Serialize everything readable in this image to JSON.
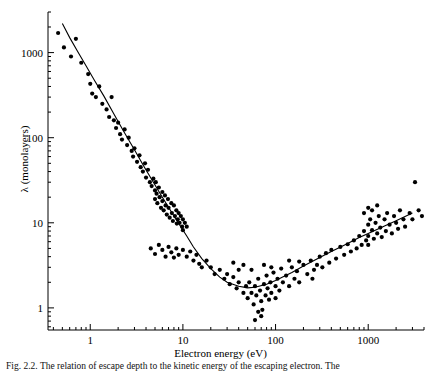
{
  "chart_data": {
    "type": "scatter",
    "title": "",
    "xlabel": "Electron energy (eV)",
    "ylabel": "λ (monolayers)",
    "xscale": "log",
    "yscale": "log",
    "xlim": [
      0.35,
      4000
    ],
    "ylim": [
      0.55,
      3000
    ],
    "xticks": [
      1,
      10,
      100,
      1000
    ],
    "xtick_labels": [
      "1",
      "10",
      "100",
      "1000"
    ],
    "yticks": [
      1,
      10,
      100,
      1000
    ],
    "ytick_labels": [
      "1",
      "10",
      "100",
      "1000"
    ],
    "grid": false,
    "legend": "none",
    "series": [
      {
        "name": "universal curve fit",
        "type": "line",
        "points": [
          [
            0.5,
            2200
          ],
          [
            0.6,
            1500
          ],
          [
            0.75,
            980
          ],
          [
            0.9,
            700
          ],
          [
            1.1,
            480
          ],
          [
            1.4,
            310
          ],
          [
            1.8,
            190
          ],
          [
            2.3,
            118
          ],
          [
            3.0,
            72
          ],
          [
            3.8,
            46
          ],
          [
            4.8,
            30
          ],
          [
            6.0,
            20
          ],
          [
            7.5,
            13.5
          ],
          [
            9.0,
            9.8
          ],
          [
            11,
            7.0
          ],
          [
            13,
            5.2
          ],
          [
            16,
            3.8
          ],
          [
            20,
            2.9
          ],
          [
            25,
            2.3
          ],
          [
            30,
            2.0
          ],
          [
            40,
            1.8
          ],
          [
            50,
            1.72
          ],
          [
            60,
            1.75
          ],
          [
            80,
            1.9
          ],
          [
            100,
            2.1
          ],
          [
            150,
            2.6
          ],
          [
            200,
            3.1
          ],
          [
            300,
            3.9
          ],
          [
            400,
            4.6
          ],
          [
            600,
            5.7
          ],
          [
            800,
            6.7
          ],
          [
            1000,
            7.5
          ],
          [
            1500,
            9.2
          ],
          [
            2000,
            10.6
          ],
          [
            3000,
            13.0
          ]
        ]
      },
      {
        "name": "measured escape depths",
        "type": "scatter",
        "points": [
          [
            0.45,
            1700
          ],
          [
            0.52,
            1150
          ],
          [
            0.62,
            900
          ],
          [
            0.7,
            1450
          ],
          [
            0.8,
            760
          ],
          [
            0.95,
            560
          ],
          [
            1.0,
            430
          ],
          [
            1.05,
            330
          ],
          [
            1.15,
            300
          ],
          [
            1.25,
            400
          ],
          [
            1.35,
            250
          ],
          [
            1.5,
            215
          ],
          [
            1.6,
            175
          ],
          [
            1.7,
            300
          ],
          [
            1.8,
            160
          ],
          [
            1.9,
            130
          ],
          [
            2.0,
            150
          ],
          [
            2.1,
            110
          ],
          [
            2.2,
            95
          ],
          [
            2.35,
            125
          ],
          [
            2.5,
            82
          ],
          [
            2.6,
            100
          ],
          [
            2.8,
            70
          ],
          [
            2.9,
            60
          ],
          [
            3.0,
            75
          ],
          [
            3.2,
            52
          ],
          [
            3.4,
            62
          ],
          [
            3.5,
            45
          ],
          [
            3.7,
            40
          ],
          [
            3.9,
            50
          ],
          [
            4.0,
            34
          ],
          [
            4.2,
            42
          ],
          [
            4.4,
            30
          ],
          [
            4.6,
            27
          ],
          [
            4.8,
            33
          ],
          [
            5.0,
            24
          ],
          [
            5.0,
            19
          ],
          [
            5.1,
            30
          ],
          [
            5.2,
            22
          ],
          [
            5.3,
            17
          ],
          [
            5.5,
            26
          ],
          [
            5.6,
            20
          ],
          [
            5.8,
            15
          ],
          [
            6.0,
            23
          ],
          [
            6.0,
            18
          ],
          [
            6.2,
            14
          ],
          [
            6.4,
            21
          ],
          [
            6.5,
            16
          ],
          [
            6.7,
            12.5
          ],
          [
            6.9,
            19
          ],
          [
            7.0,
            15
          ],
          [
            7.2,
            11.5
          ],
          [
            7.5,
            17
          ],
          [
            7.6,
            13
          ],
          [
            7.8,
            10.5
          ],
          [
            8.0,
            16
          ],
          [
            8.2,
            12
          ],
          [
            8.5,
            14
          ],
          [
            8.6,
            9.8
          ],
          [
            8.8,
            11
          ],
          [
            9.0,
            13
          ],
          [
            9.2,
            10
          ],
          [
            9.5,
            12
          ],
          [
            9.8,
            9.0
          ],
          [
            10,
            11
          ],
          [
            10,
            8.2
          ],
          [
            10.5,
            10
          ],
          [
            11,
            9.0
          ],
          [
            4.5,
            5.0
          ],
          [
            5.0,
            4.3
          ],
          [
            5.5,
            5.5
          ],
          [
            6.0,
            4.8
          ],
          [
            6.5,
            4.0
          ],
          [
            7.0,
            5.2
          ],
          [
            7.5,
            4.5
          ],
          [
            8.0,
            3.9
          ],
          [
            8.5,
            5.0
          ],
          [
            9.0,
            4.2
          ],
          [
            10,
            4.8
          ],
          [
            11,
            4.0
          ],
          [
            12,
            4.6
          ],
          [
            13,
            3.6
          ],
          [
            14,
            4.2
          ],
          [
            15,
            3.3
          ],
          [
            16,
            3.0
          ],
          [
            18,
            3.6
          ],
          [
            20,
            3.0
          ],
          [
            22,
            2.5
          ],
          [
            25,
            2.8
          ],
          [
            28,
            2.2
          ],
          [
            30,
            2.5
          ],
          [
            32,
            1.9
          ],
          [
            35,
            2.3
          ],
          [
            38,
            1.7
          ],
          [
            40,
            2.0
          ],
          [
            45,
            1.5
          ],
          [
            48,
            1.8
          ],
          [
            50,
            1.3
          ],
          [
            52,
            2.0
          ],
          [
            55,
            1.5
          ],
          [
            58,
            1.1
          ],
          [
            60,
            1.8
          ],
          [
            62,
            1.4
          ],
          [
            65,
            2.2
          ],
          [
            68,
            1.6
          ],
          [
            70,
            1.2
          ],
          [
            72,
            0.95
          ],
          [
            75,
            1.9
          ],
          [
            78,
            1.4
          ],
          [
            80,
            2.4
          ],
          [
            82,
            1.7
          ],
          [
            85,
            1.25
          ],
          [
            88,
            2.0
          ],
          [
            90,
            1.5
          ],
          [
            95,
            2.6
          ],
          [
            100,
            1.8
          ],
          [
            100,
            1.3
          ],
          [
            105,
            2.2
          ],
          [
            110,
            1.6
          ],
          [
            115,
            2.9
          ],
          [
            120,
            2.0
          ],
          [
            130,
            2.4
          ],
          [
            140,
            1.8
          ],
          [
            150,
            3.0
          ],
          [
            160,
            2.2
          ],
          [
            170,
            2.7
          ],
          [
            180,
            2.0
          ],
          [
            200,
            3.2
          ],
          [
            220,
            2.5
          ],
          [
            240,
            3.6
          ],
          [
            260,
            2.8
          ],
          [
            280,
            3.2
          ],
          [
            300,
            4.0
          ],
          [
            320,
            3.0
          ],
          [
            350,
            4.4
          ],
          [
            380,
            3.4
          ],
          [
            400,
            4.8
          ],
          [
            450,
            3.8
          ],
          [
            500,
            5.2
          ],
          [
            550,
            4.2
          ],
          [
            600,
            5.6
          ],
          [
            650,
            4.6
          ],
          [
            700,
            6.2
          ],
          [
            750,
            5.0
          ],
          [
            800,
            7.0
          ],
          [
            850,
            5.5
          ],
          [
            900,
            8.0
          ],
          [
            950,
            6.2
          ],
          [
            1000,
            9.5
          ],
          [
            1000,
            7.0
          ],
          [
            1000,
            5.5
          ],
          [
            1050,
            11
          ],
          [
            1100,
            8.2
          ],
          [
            1150,
            6.5
          ],
          [
            1200,
            10
          ],
          [
            1250,
            7.5
          ],
          [
            1300,
            12
          ],
          [
            1350,
            8.8
          ],
          [
            1400,
            6.8
          ],
          [
            1500,
            11
          ],
          [
            1550,
            8.0
          ],
          [
            1600,
            13
          ],
          [
            1700,
            9.5
          ],
          [
            1800,
            7.5
          ],
          [
            1900,
            12
          ],
          [
            2000,
            10
          ],
          [
            2100,
            8.5
          ],
          [
            2200,
            14
          ],
          [
            2400,
            11
          ],
          [
            2500,
            9.0
          ],
          [
            2800,
            13
          ],
          [
            3000,
            11
          ],
          [
            3200,
            30
          ],
          [
            3500,
            14
          ],
          [
            3800,
            12
          ],
          [
            1000,
            15
          ],
          [
            1100,
            14
          ],
          [
            1250,
            16
          ],
          [
            900,
            13
          ],
          [
            60,
            0.72
          ],
          [
            70,
            0.8
          ],
          [
            65,
            0.9
          ],
          [
            55,
            2.8
          ],
          [
            45,
            3.2
          ],
          [
            40,
            2.8
          ],
          [
            35,
            3.4
          ],
          [
            250,
            2.2
          ],
          [
            180,
            3.5
          ],
          [
            140,
            3.6
          ],
          [
            90,
            3.0
          ],
          [
            75,
            3.2
          ]
        ]
      }
    ]
  },
  "caption": {
    "text": "Fig. 2.2.  The relation of escape depth to the kinetic energy of the escaping electron. The"
  },
  "axes": {
    "xlabel": "Electron energy (eV)",
    "ylabel": "λ (monolayers)"
  },
  "colors": {
    "ink": "#000000",
    "background": "#ffffff"
  }
}
